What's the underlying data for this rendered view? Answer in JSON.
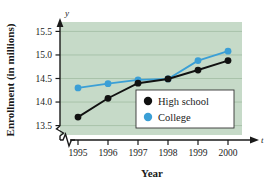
{
  "chart_data": {
    "type": "line",
    "title": "",
    "xlabel": "Year",
    "ylabel": "Enrollment (in millions)",
    "x_axis_variable": "t",
    "y_axis_variable": "y",
    "categories": [
      "1995",
      "1996",
      "1997",
      "1998",
      "1999",
      "2000"
    ],
    "xtick_labels": [
      "1995",
      "1996",
      "1997",
      "1998",
      "1999",
      "2000"
    ],
    "ytick_labels": [
      "13.5",
      "14.0",
      "14.5",
      "15.0",
      "15.5"
    ],
    "ytick_values": [
      13.5,
      14.0,
      14.5,
      15.0,
      15.5
    ],
    "ylim": [
      13.3,
      15.7
    ],
    "y_axis_broken": true,
    "x_axis_broken": true,
    "grid": true,
    "legend_position": "inside-bottom-right",
    "plot_background": "#c6dac8",
    "series": [
      {
        "name": "High school",
        "color": "#111111",
        "values": [
          13.68,
          14.08,
          14.4,
          14.49,
          14.68,
          14.88
        ]
      },
      {
        "name": "College",
        "color": "#3b9fd6",
        "values": [
          14.3,
          14.39,
          14.47,
          14.49,
          14.88,
          15.08
        ]
      }
    ]
  },
  "legend": {
    "items": [
      {
        "label": "High school",
        "marker_color": "#111111"
      },
      {
        "label": "College",
        "marker_color": "#3b9fd6"
      }
    ]
  },
  "axes": {
    "y_label": "Enrollment (in millions)",
    "x_label": "Year",
    "y_var": "y",
    "x_var": "t"
  }
}
